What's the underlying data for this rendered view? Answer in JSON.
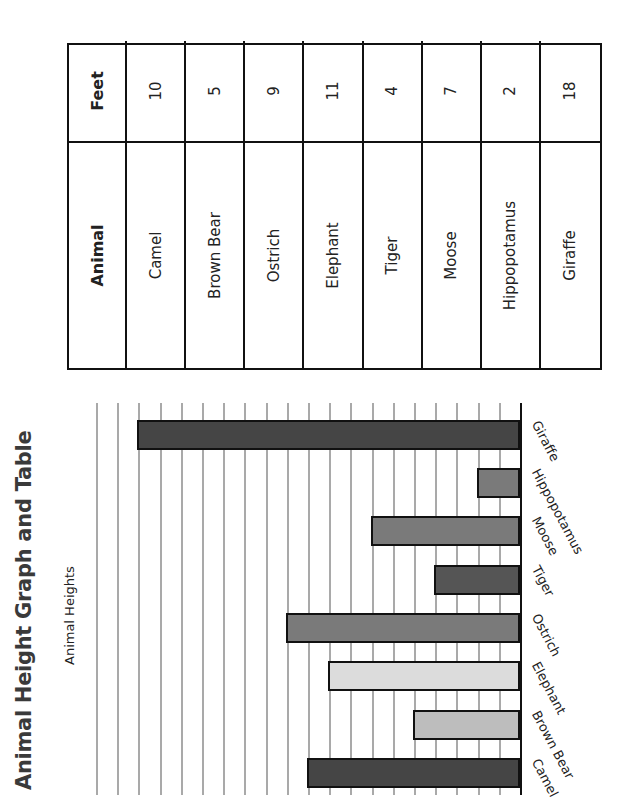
{
  "page": {
    "title": "Animal Height Graph and Table"
  },
  "chart_data": {
    "type": "bar",
    "title": "Animal Heights",
    "categories": [
      "Camel",
      "Brown Bear",
      "Elephant",
      "Ostrich",
      "Tiger",
      "Moose",
      "Hippopotamus",
      "Giraffe"
    ],
    "values": [
      10,
      5,
      9,
      11,
      4,
      7,
      2,
      18
    ],
    "colors": [
      "#454545",
      "#bdbdbd",
      "#dcdcdc",
      "#7a7a7a",
      "#555555",
      "#7a7a7a",
      "#7a7a7a",
      "#454545"
    ],
    "xlabel": "",
    "ylabel": "",
    "ylim": [
      0,
      20
    ],
    "grid": true,
    "gridline_step": 1,
    "tick_labels_shown": false,
    "legend": "none",
    "orientation": "vertical bars; page rotated 90 degrees counter-clockwise"
  },
  "table": {
    "headers": [
      "Animal",
      "Feet"
    ],
    "rows": [
      {
        "animal": "Camel",
        "feet": "10"
      },
      {
        "animal": "Brown Bear",
        "feet": "5"
      },
      {
        "animal": "Ostrich",
        "feet": "9"
      },
      {
        "animal": "Elephant",
        "feet": "11"
      },
      {
        "animal": "Tiger",
        "feet": "4"
      },
      {
        "animal": "Moose",
        "feet": "7"
      },
      {
        "animal": "Hippopotamus",
        "feet": "2"
      },
      {
        "animal": "Giraffe",
        "feet": "18"
      }
    ]
  }
}
